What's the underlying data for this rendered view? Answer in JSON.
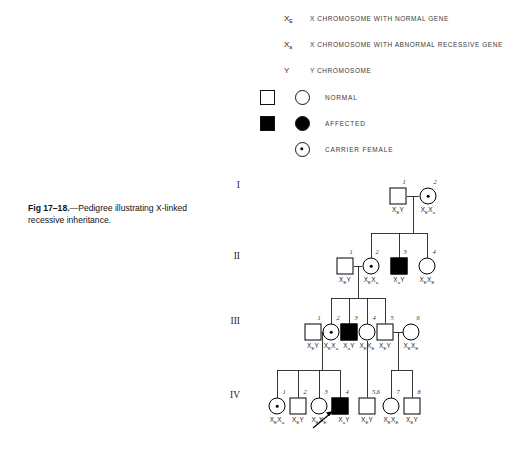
{
  "figure": {
    "caption_label": "Fig 17–18.",
    "caption_dash": "—",
    "caption_text": "Pedigree illustrating X-linked recessive inheritance."
  },
  "gene_key": [
    {
      "symbol_base": "X",
      "symbol_sub": "E",
      "description": "X CHROMOSOME WITH NORMAL GENE"
    },
    {
      "symbol_base": "X",
      "symbol_sub": "a",
      "description": "X CHROMOSOME WITH ABNORMAL RECESSIVE GENE"
    },
    {
      "symbol_base": "Y",
      "symbol_sub": "",
      "description": "Y CHROMOSOME"
    }
  ],
  "symbol_key": [
    {
      "label": "NORMAL",
      "has_square": true,
      "has_circle": true,
      "state": "normal"
    },
    {
      "label": "AFFECTED",
      "has_square": true,
      "has_circle": true,
      "state": "affected"
    },
    {
      "label": "CARRIER FEMALE",
      "has_square": false,
      "has_circle": true,
      "state": "carrier"
    }
  ],
  "generations": [
    {
      "numeral": "I"
    },
    {
      "numeral": "II"
    },
    {
      "numeral": "III"
    },
    {
      "numeral": "IV"
    }
  ],
  "individuals": [
    {
      "gen": "I",
      "index": "1",
      "sex": "male",
      "state": "normal",
      "geno_parts": [
        [
          "X",
          "E"
        ],
        [
          "Y",
          ""
        ]
      ]
    },
    {
      "gen": "I",
      "index": "2",
      "sex": "female",
      "state": "carrier",
      "geno_parts": [
        [
          "X",
          "E"
        ],
        [
          "X",
          "a"
        ]
      ]
    },
    {
      "gen": "II",
      "index": "1",
      "sex": "male",
      "state": "normal",
      "geno_parts": [
        [
          "X",
          "E"
        ],
        [
          "Y",
          ""
        ]
      ]
    },
    {
      "gen": "II",
      "index": "2",
      "sex": "female",
      "state": "carrier",
      "geno_parts": [
        [
          "X",
          "E"
        ],
        [
          "X",
          "a"
        ]
      ]
    },
    {
      "gen": "II",
      "index": "3",
      "sex": "male",
      "state": "affected",
      "geno_parts": [
        [
          "X",
          "a"
        ],
        [
          "Y",
          ""
        ]
      ]
    },
    {
      "gen": "II",
      "index": "4",
      "sex": "female",
      "state": "normal",
      "geno_parts": [
        [
          "X",
          "E"
        ],
        [
          "X",
          "E"
        ]
      ]
    },
    {
      "gen": "III",
      "index": "1",
      "sex": "male",
      "state": "normal",
      "geno_parts": [
        [
          "X",
          "E"
        ],
        [
          "Y",
          ""
        ]
      ]
    },
    {
      "gen": "III",
      "index": "2",
      "sex": "female",
      "state": "carrier",
      "geno_parts": [
        [
          "X",
          "E"
        ],
        [
          "X",
          "a"
        ]
      ]
    },
    {
      "gen": "III",
      "index": "3",
      "sex": "male",
      "state": "affected",
      "geno_parts": [
        [
          "X",
          "a"
        ],
        [
          "Y",
          ""
        ]
      ]
    },
    {
      "gen": "III",
      "index": "4",
      "sex": "female",
      "state": "normal",
      "geno_parts": [
        [
          "X",
          "E"
        ],
        [
          "X",
          "E"
        ]
      ]
    },
    {
      "gen": "III",
      "index": "5",
      "sex": "male",
      "state": "normal",
      "geno_parts": [
        [
          "X",
          "E"
        ],
        [
          "Y",
          ""
        ]
      ]
    },
    {
      "gen": "III",
      "index": "6",
      "sex": "female",
      "state": "normal",
      "geno_parts": [
        [
          "X",
          "E"
        ],
        [
          "X",
          "E"
        ]
      ]
    },
    {
      "gen": "IV",
      "index": "1",
      "sex": "female",
      "state": "carrier",
      "geno_parts": [
        [
          "X",
          "E"
        ],
        [
          "X",
          "a"
        ]
      ]
    },
    {
      "gen": "IV",
      "index": "2",
      "sex": "male",
      "state": "normal",
      "geno_parts": [
        [
          "X",
          "E"
        ],
        [
          "Y",
          ""
        ]
      ]
    },
    {
      "gen": "IV",
      "index": "3",
      "sex": "female",
      "state": "normal",
      "geno_parts": [
        [
          "X",
          "E"
        ],
        [
          "X",
          "E"
        ]
      ]
    },
    {
      "gen": "IV",
      "index": "4",
      "sex": "male",
      "state": "affected",
      "geno_parts": [
        [
          "X",
          "a"
        ],
        [
          "Y",
          ""
        ]
      ],
      "proband": true
    },
    {
      "gen": "IV",
      "index": "5,6",
      "sex": "male",
      "state": "normal",
      "geno_parts": [
        [
          "X",
          "E"
        ],
        [
          "Y",
          ""
        ]
      ]
    },
    {
      "gen": "IV",
      "index": "7",
      "sex": "female",
      "state": "normal",
      "geno_parts": [
        [
          "X",
          "E"
        ],
        [
          "X",
          "E"
        ]
      ]
    },
    {
      "gen": "IV",
      "index": "8",
      "sex": "male",
      "state": "normal",
      "geno_parts": [
        [
          "X",
          "E"
        ],
        [
          "Y",
          ""
        ]
      ]
    }
  ],
  "colors": {
    "ink": "#000000",
    "line": "#222222",
    "background": "#ffffff",
    "legend_text": "#3a3a3a"
  }
}
